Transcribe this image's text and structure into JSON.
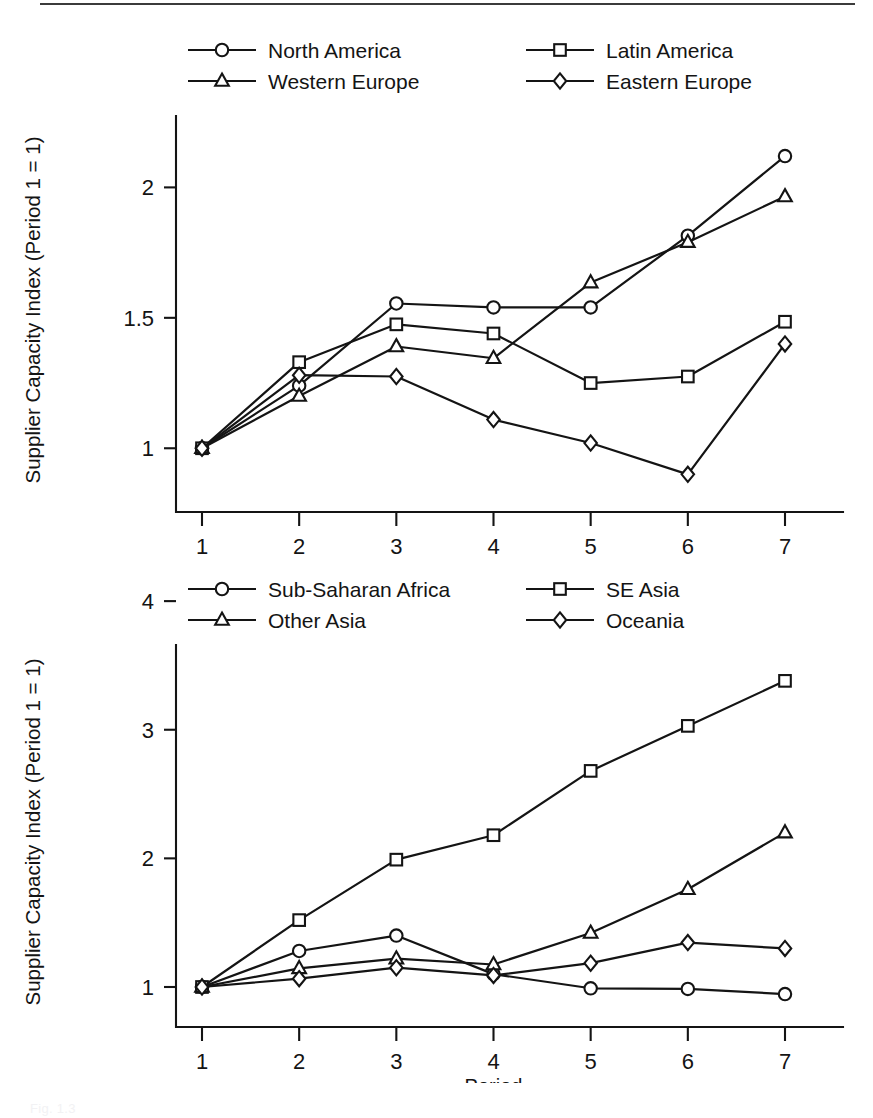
{
  "page": {
    "background_color": "#ffffff",
    "ink_color": "#141414",
    "rule_color": "#3b3b3b",
    "caption_faint": "Fig. 1.3"
  },
  "charts": [
    {
      "id": "top",
      "ylabel": "Supplier Capacity Index (Period 1 = 1)",
      "xlabel": "Period",
      "legend": [
        {
          "label": "North America",
          "marker": "circle"
        },
        {
          "label": "Latin America",
          "marker": "square"
        },
        {
          "label": "Western Europe",
          "marker": "triangle"
        },
        {
          "label": "Eastern Europe",
          "marker": "diamond"
        }
      ],
      "xticks": [
        "1",
        "2",
        "3",
        "4",
        "5",
        "6",
        "7"
      ],
      "yticks": [
        "1",
        "1.5",
        "2"
      ]
    },
    {
      "id": "bottom",
      "ylabel": "Supplier Capacity Index (Period 1 = 1)",
      "xlabel": "Period",
      "legend": [
        {
          "label": "Sub-Saharan Africa",
          "marker": "circle"
        },
        {
          "label": "SE Asia",
          "marker": "square"
        },
        {
          "label": "Other Asia",
          "marker": "triangle"
        },
        {
          "label": "Oceania",
          "marker": "diamond"
        }
      ],
      "xticks": [
        "1",
        "2",
        "3",
        "4",
        "5",
        "6",
        "7"
      ],
      "yticks": [
        "1",
        "2",
        "3",
        "4"
      ]
    }
  ],
  "chart_data": [
    {
      "type": "line",
      "title": "",
      "xlabel": "Period",
      "ylabel": "Supplier Capacity Index (Period 1 = 1)",
      "x": [
        1,
        2,
        3,
        4,
        5,
        6,
        7
      ],
      "categories": [
        "1",
        "2",
        "3",
        "4",
        "5",
        "6",
        "7"
      ],
      "xlim": [
        1,
        7
      ],
      "ylim": [
        0.84,
        2.22
      ],
      "ytick_values": [
        1,
        1.5,
        2
      ],
      "ytick_labels": [
        "1",
        "1.5",
        "2"
      ],
      "grid": false,
      "legend_position": "top",
      "series": [
        {
          "name": "North America",
          "marker": "circle",
          "values": [
            1.0,
            1.24,
            1.555,
            1.54,
            1.54,
            1.815,
            2.12
          ]
        },
        {
          "name": "Latin America",
          "marker": "square",
          "values": [
            1.0,
            1.33,
            1.475,
            1.44,
            1.25,
            1.275,
            1.485
          ]
        },
        {
          "name": "Western Europe",
          "marker": "triangle",
          "values": [
            1.0,
            1.2,
            1.39,
            1.345,
            1.635,
            1.79,
            1.965
          ]
        },
        {
          "name": "Eastern Europe",
          "marker": "diamond",
          "values": [
            1.0,
            1.28,
            1.275,
            1.11,
            1.02,
            0.9,
            1.4
          ]
        }
      ]
    },
    {
      "type": "line",
      "title": "",
      "xlabel": "Period",
      "ylabel": "Supplier Capacity Index (Period 1 = 1)",
      "x": [
        1,
        2,
        3,
        4,
        5,
        6,
        7
      ],
      "categories": [
        "1",
        "2",
        "3",
        "4",
        "5",
        "6",
        "7"
      ],
      "xlim": [
        1,
        7
      ],
      "ylim": [
        0.86,
        3.55
      ],
      "ytick_values": [
        1,
        2,
        3,
        4
      ],
      "ytick_labels": [
        "1",
        "2",
        "3",
        "4"
      ],
      "grid": false,
      "legend_position": "top",
      "series": [
        {
          "name": "Sub-Saharan Africa",
          "marker": "circle",
          "values": [
            1.0,
            1.28,
            1.4,
            1.1,
            0.99,
            0.985,
            0.945
          ]
        },
        {
          "name": "SE Asia",
          "marker": "square",
          "values": [
            1.0,
            1.52,
            1.99,
            2.18,
            2.68,
            3.03,
            3.38
          ]
        },
        {
          "name": "Other Asia",
          "marker": "triangle",
          "values": [
            1.0,
            1.145,
            1.22,
            1.175,
            1.42,
            1.76,
            2.2
          ]
        },
        {
          "name": "Oceania",
          "marker": "diamond",
          "values": [
            1.0,
            1.065,
            1.15,
            1.09,
            1.185,
            1.345,
            1.3
          ]
        }
      ]
    }
  ]
}
